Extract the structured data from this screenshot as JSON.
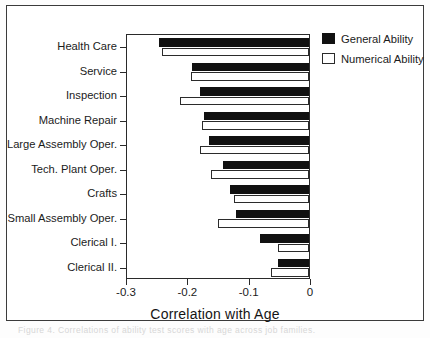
{
  "figure": {
    "scan_artifact_text": "Figure 4. Correlations of ability test scores with age across job families."
  },
  "chart_data": {
    "type": "bar",
    "orientation": "horizontal",
    "title": "",
    "xlabel": "Correlation with Age",
    "ylabel": "",
    "xlim": [
      -0.3,
      0
    ],
    "xticks": [
      -0.3,
      -0.2,
      -0.1,
      0
    ],
    "xtick_labels": [
      "-0.3",
      "-0.2",
      "-0.1",
      "0"
    ],
    "grid": false,
    "legend_position": "top-right",
    "categories": [
      "Health Care",
      "Service",
      "Inspection",
      "Machine Repair",
      "Large Assembly Oper.",
      "Tech. Plant Oper.",
      "Crafts",
      "Small Assembly Oper.",
      "Clerical I.",
      "Clerical II."
    ],
    "series": [
      {
        "name": "General Ability",
        "color": "#111111",
        "values": [
          -0.245,
          -0.19,
          -0.178,
          -0.172,
          -0.163,
          -0.14,
          -0.129,
          -0.119,
          -0.08,
          -0.05
        ]
      },
      {
        "name": "Numerical Ability",
        "color": "#ffffff",
        "values": [
          -0.24,
          -0.192,
          -0.21,
          -0.175,
          -0.177,
          -0.16,
          -0.122,
          -0.148,
          -0.051,
          -0.062
        ]
      }
    ]
  },
  "legend": {
    "items": [
      {
        "label": "General Ability",
        "swatch": "filled-black-swatch"
      },
      {
        "label": "Numerical Ability",
        "swatch": "open-white-swatch"
      }
    ]
  }
}
